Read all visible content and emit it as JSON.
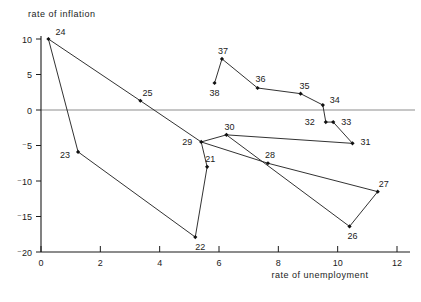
{
  "chart_data": {
    "type": "scatter",
    "title": "",
    "xlabel": "rate of unemployment",
    "ylabel": "rate of inflation",
    "xlim": [
      0,
      12.6
    ],
    "ylim": [
      -20,
      10.6
    ],
    "xticks": [
      0,
      2,
      4,
      6,
      8,
      10,
      12
    ],
    "xticklabels": [
      "0",
      "2",
      "4",
      "6",
      "8",
      "10",
      "12"
    ],
    "yticks": [
      10,
      5,
      0,
      -5,
      -10,
      -15,
      -20
    ],
    "yticklabels": [
      "10",
      "5",
      "0",
      "⁻5",
      "⁻10",
      "⁻15",
      "⁻20"
    ],
    "grid": false,
    "legend": "none",
    "zero_line": true,
    "connected": true,
    "marker": "filled-diamond",
    "series": [
      {
        "name": "inflation vs unemployment path",
        "points": [
          {
            "label": "24",
            "x": 0.25,
            "y": 10.0,
            "label_dx": 7,
            "label_dy": -4
          },
          {
            "label": "23",
            "x": 1.25,
            "y": -5.9,
            "label_dx": -18,
            "label_dy": 6
          },
          {
            "label": "22",
            "x": 5.2,
            "y": -17.9,
            "label_dx": 0,
            "label_dy": 13
          },
          {
            "label": "21",
            "x": 5.6,
            "y": -8.0,
            "label_dx": -2,
            "label_dy": -5
          },
          {
            "label": "29",
            "x": 5.4,
            "y": -4.5,
            "label_dx": -19,
            "label_dy": 3
          },
          {
            "label": "30",
            "x": 6.25,
            "y": -3.5,
            "label_dx": -2,
            "label_dy": -5
          },
          {
            "label": "31",
            "x": 10.5,
            "y": -4.7,
            "label_dx": 8,
            "label_dy": 2
          },
          {
            "label": "33",
            "x": 9.85,
            "y": -1.7,
            "label_dx": 8,
            "label_dy": 3
          },
          {
            "label": "32",
            "x": 9.6,
            "y": -1.7,
            "label_dx": -21,
            "label_dy": 3
          },
          {
            "label": "34",
            "x": 9.5,
            "y": 0.7,
            "label_dx": 7,
            "label_dy": -2
          },
          {
            "label": "35",
            "x": 8.75,
            "y": 2.3,
            "label_dx": -1,
            "label_dy": -5
          },
          {
            "label": "36",
            "x": 7.3,
            "y": 3.1,
            "label_dx": -2,
            "label_dy": -6
          },
          {
            "label": "37",
            "x": 6.1,
            "y": 7.2,
            "label_dx": -4,
            "label_dy": -5
          },
          {
            "label": "38",
            "x": 5.85,
            "y": 3.8,
            "label_dx": -5,
            "label_dy": 13
          },
          {
            "label": "25",
            "x": 3.35,
            "y": 1.3,
            "label_dx": 2,
            "label_dy": -5
          },
          {
            "label": "28",
            "x": 7.65,
            "y": -7.5,
            "label_dx": -3,
            "label_dy": -5
          },
          {
            "label": "26",
            "x": 10.4,
            "y": -16.4,
            "label_dx": -2,
            "label_dy": 13
          },
          {
            "label": "27",
            "x": 11.35,
            "y": -11.5,
            "label_dx": 1,
            "label_dy": -5
          }
        ],
        "path_order": [
          "24",
          "23",
          "22",
          "21",
          "29",
          "30",
          "31",
          "33",
          "32",
          "34",
          "35",
          "36",
          "37",
          "38"
        ],
        "extra_segments": [
          {
            "from": "24",
            "to": "25"
          },
          {
            "from": "25",
            "to": "29"
          },
          {
            "from": "29",
            "to": "28"
          },
          {
            "from": "28",
            "to": "27"
          },
          {
            "from": "30",
            "to": "26"
          },
          {
            "from": "26",
            "to": "27"
          }
        ]
      }
    ]
  },
  "colors": {
    "ink": "#1b1b1b",
    "marker": "#111111",
    "zero_line": "#8d8d8d",
    "background": "#ffffff"
  }
}
